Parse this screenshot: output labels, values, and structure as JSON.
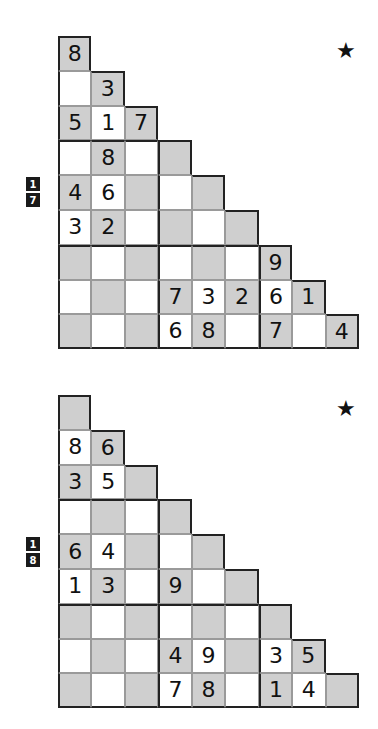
{
  "colors": {
    "gray_cell": "#cfcfcf",
    "white_cell": "#ffffff",
    "label_bg": "#1a1a1a"
  },
  "puzzles": [
    {
      "label_top": "1",
      "label_bottom": "7",
      "star_icon": "★",
      "rows": [
        [
          "8"
        ],
        [
          "",
          "3"
        ],
        [
          "5",
          "1",
          "7"
        ],
        [
          "",
          "8",
          "",
          ""
        ],
        [
          "4",
          "6",
          "",
          "",
          ""
        ],
        [
          "3",
          "2",
          "",
          "",
          "",
          ""
        ],
        [
          "",
          "",
          "",
          "",
          "",
          "",
          "9"
        ],
        [
          "",
          "",
          "",
          "7",
          "3",
          "2",
          "6",
          "1"
        ],
        [
          "",
          "",
          "",
          "6",
          "8",
          "",
          "7",
          "",
          "4"
        ]
      ]
    },
    {
      "label_top": "1",
      "label_bottom": "8",
      "star_icon": "★",
      "rows": [
        [
          ""
        ],
        [
          "8",
          "6"
        ],
        [
          "3",
          "5",
          ""
        ],
        [
          "",
          "",
          "",
          ""
        ],
        [
          "6",
          "4",
          "",
          "",
          ""
        ],
        [
          "1",
          "3",
          "",
          "9",
          "",
          ""
        ],
        [
          "",
          "",
          "",
          "",
          "",
          "",
          ""
        ],
        [
          "",
          "",
          "",
          "4",
          "9",
          "",
          "3",
          "5"
        ],
        [
          "",
          "",
          "",
          "7",
          "8",
          "",
          "1",
          "4",
          ""
        ]
      ]
    }
  ]
}
